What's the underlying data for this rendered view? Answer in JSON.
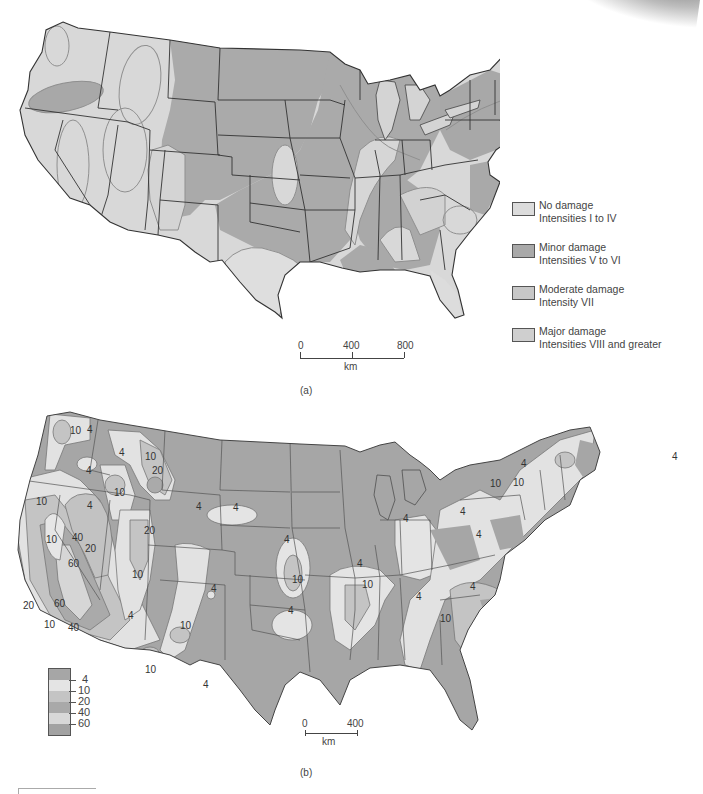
{
  "figure": {
    "panel_a": {
      "caption": "(a)",
      "legend": [
        {
          "title": "No damage",
          "subtitle": "Intensities I to IV",
          "color": "#dcdcdc"
        },
        {
          "title": "Minor damage",
          "subtitle": "Intensities V to VI",
          "color": "#a9a9a9"
        },
        {
          "title": "Moderate damage",
          "subtitle": "Intensity VII",
          "color": "#c7c7c7"
        },
        {
          "title": "Major damage",
          "subtitle": "Intensities VIII and greater",
          "color": "#cfcfcf"
        }
      ],
      "scale": {
        "labels": [
          "0",
          "400",
          "800"
        ],
        "unit": "km"
      }
    },
    "panel_b": {
      "caption": "(b)",
      "legend": {
        "values": [
          "4",
          "10",
          "20",
          "40",
          "60"
        ],
        "colors": [
          "#a6a6a6",
          "#e4e4e4",
          "#c4c4c4",
          "#a9a9a9",
          "#d8d8d8",
          "#a2a2a2"
        ]
      },
      "scale": {
        "labels": [
          "0",
          "400"
        ],
        "unit": "km"
      },
      "contour_labels": [
        {
          "text": "10",
          "x": 70,
          "y": 434
        },
        {
          "text": "4",
          "x": 87,
          "y": 433
        },
        {
          "text": "4",
          "x": 86,
          "y": 474
        },
        {
          "text": "4",
          "x": 119,
          "y": 456
        },
        {
          "text": "10",
          "x": 145,
          "y": 460
        },
        {
          "text": "20",
          "x": 152,
          "y": 474
        },
        {
          "text": "10",
          "x": 114,
          "y": 496
        },
        {
          "text": "10",
          "x": 36,
          "y": 505
        },
        {
          "text": "4",
          "x": 87,
          "y": 509
        },
        {
          "text": "10",
          "x": 46,
          "y": 543
        },
        {
          "text": "40",
          "x": 72,
          "y": 541
        },
        {
          "text": "20",
          "x": 85,
          "y": 552
        },
        {
          "text": "20",
          "x": 144,
          "y": 534
        },
        {
          "text": "60",
          "x": 68,
          "y": 567
        },
        {
          "text": "10",
          "x": 132,
          "y": 578
        },
        {
          "text": "4",
          "x": 233,
          "y": 511
        },
        {
          "text": "4",
          "x": 196,
          "y": 510
        },
        {
          "text": "4",
          "x": 211,
          "y": 592
        },
        {
          "text": "60",
          "x": 54,
          "y": 607
        },
        {
          "text": "20",
          "x": 23,
          "y": 609
        },
        {
          "text": "10",
          "x": 44,
          "y": 628
        },
        {
          "text": "40",
          "x": 68,
          "y": 631
        },
        {
          "text": "4",
          "x": 128,
          "y": 619
        },
        {
          "text": "10",
          "x": 180,
          "y": 629
        },
        {
          "text": "10",
          "x": 145,
          "y": 673
        },
        {
          "text": "4",
          "x": 203,
          "y": 688
        },
        {
          "text": "4",
          "x": 284,
          "y": 543
        },
        {
          "text": "10",
          "x": 292,
          "y": 583
        },
        {
          "text": "4",
          "x": 357,
          "y": 567
        },
        {
          "text": "10",
          "x": 362,
          "y": 588
        },
        {
          "text": "4",
          "x": 288,
          "y": 614
        },
        {
          "text": "4",
          "x": 416,
          "y": 600
        },
        {
          "text": "10",
          "x": 440,
          "y": 622
        },
        {
          "text": "4",
          "x": 470,
          "y": 590
        },
        {
          "text": "4",
          "x": 403,
          "y": 522
        },
        {
          "text": "4",
          "x": 460,
          "y": 515
        },
        {
          "text": "4",
          "x": 476,
          "y": 538
        },
        {
          "text": "10",
          "x": 490,
          "y": 487
        },
        {
          "text": "10",
          "x": 513,
          "y": 486
        },
        {
          "text": "4",
          "x": 521,
          "y": 467
        },
        {
          "text": "4",
          "x": 672,
          "y": 460
        }
      ]
    }
  }
}
